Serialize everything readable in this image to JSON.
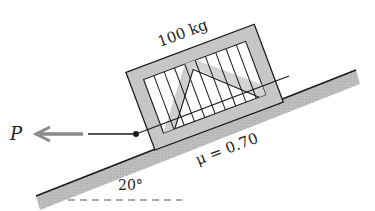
{
  "figure": {
    "mass_label": "100 kg",
    "friction_label": "μ = 0.70",
    "angle_label": "20°",
    "force_label": "P"
  },
  "colors": {
    "line": "#1a1a1a",
    "shade": "#b9b9b9",
    "crate_fill": "#c8c8c8",
    "slat_fill": "#ffffff",
    "arrow": "#8a8a8a"
  }
}
